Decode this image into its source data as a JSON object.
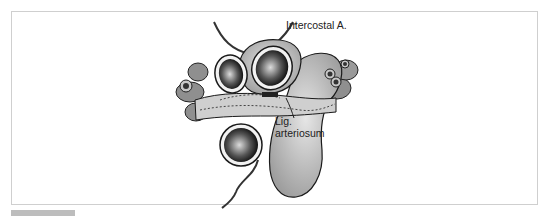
{
  "figure": {
    "type": "anatomical illustration",
    "labels": {
      "intercostal": "Intercostal A.",
      "lig_line1": "Lig.",
      "lig_line2": "arteriosum"
    },
    "colors": {
      "vessel_fill": "#b9b9b9",
      "vessel_light": "#d8d8d8",
      "outline": "#1a1a1a",
      "lumen": "#111111",
      "frame_border": "#cfcfcf",
      "caption_bar": "#bdbdbd"
    }
  }
}
